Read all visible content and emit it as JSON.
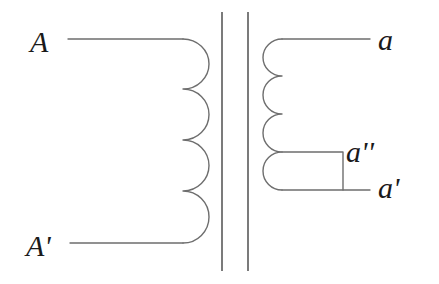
{
  "diagram": {
    "type": "transformer-schematic",
    "colors": {
      "line": "#6e6e6e",
      "core": "#5a5a5a",
      "text": "#1a1a1a",
      "background": "#ffffff"
    },
    "primary": {
      "turns": 4,
      "terminals": [
        {
          "id": "A",
          "label": "A",
          "position": "top"
        },
        {
          "id": "A_prime",
          "label": "A'",
          "position": "bottom"
        }
      ]
    },
    "core": {
      "lines": 2
    },
    "secondary": {
      "turns": 4,
      "terminals": [
        {
          "id": "a",
          "label": "a",
          "position": "top"
        },
        {
          "id": "a_double_prime",
          "label": "a''",
          "position": "tap"
        },
        {
          "id": "a_prime",
          "label": "a'",
          "position": "bottom"
        }
      ]
    }
  }
}
